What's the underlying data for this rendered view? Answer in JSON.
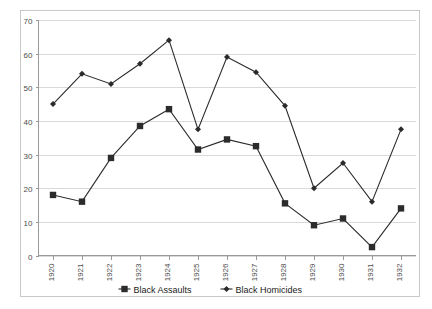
{
  "chart_data": {
    "type": "line",
    "title": "",
    "xlabel": "",
    "ylabel": "",
    "ylim": [
      0,
      70
    ],
    "ytick_step": 10,
    "yticks": [
      0,
      10,
      20,
      30,
      40,
      50,
      60,
      70
    ],
    "grid": true,
    "legend_position": "bottom",
    "categories": [
      "1920",
      "1921",
      "1922",
      "1923",
      "1924",
      "1925",
      "1926",
      "1927",
      "1928",
      "1929",
      "1930",
      "1931",
      "1932"
    ],
    "series": [
      {
        "name": "Black Assaults",
        "marker": "square",
        "color": "#2b2b2b",
        "values": [
          18,
          16,
          29,
          38.5,
          43.5,
          31.5,
          34.5,
          32.5,
          15.5,
          9,
          11,
          2.5,
          14
        ]
      },
      {
        "name": "Black Homicides",
        "marker": "diamond",
        "color": "#2b2b2b",
        "values": [
          45,
          54,
          51,
          57,
          64,
          37.5,
          59,
          54.5,
          44.5,
          20,
          27.5,
          16,
          37.5
        ]
      }
    ]
  },
  "legend": {
    "items": [
      {
        "label": "Black Assaults",
        "marker": "square"
      },
      {
        "label": "Black Homicides",
        "marker": "diamond"
      }
    ]
  },
  "axes": {
    "y_labels": [
      "70",
      "60",
      "50",
      "40",
      "30",
      "20",
      "10",
      "0"
    ],
    "x_labels": [
      "1920",
      "1921",
      "1922",
      "1923",
      "1924",
      "1925",
      "1926",
      "1927",
      "1928",
      "1929",
      "1930",
      "1931",
      "1932"
    ]
  }
}
